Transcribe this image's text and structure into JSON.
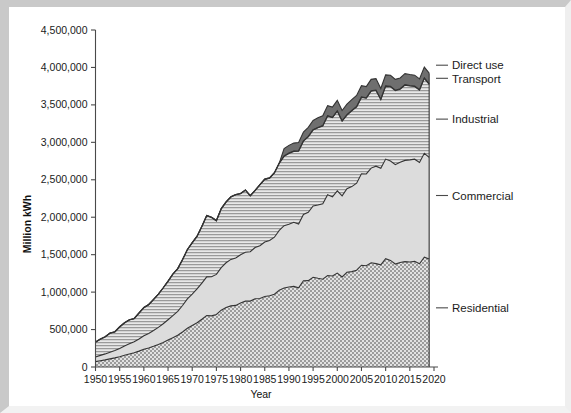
{
  "chart_data": {
    "type": "area",
    "stacked": true,
    "title": "",
    "xlabel": "Year",
    "ylabel": "Million kWh",
    "xlim": [
      1950,
      2020
    ],
    "ylim": [
      0,
      4500000
    ],
    "ytick_values": [
      0,
      500000,
      1000000,
      1500000,
      2000000,
      2500000,
      3000000,
      3500000,
      4000000,
      4500000
    ],
    "ytick_labels": [
      "0",
      "500,000",
      "1,000,000",
      "1,500,000",
      "2,000,000",
      "2,500,000",
      "3,000,000",
      "3,500,000",
      "4,000,000",
      "4,500,000"
    ],
    "xtick_values": [
      1950,
      1955,
      1960,
      1965,
      1970,
      1975,
      1980,
      1985,
      1990,
      1995,
      2000,
      2005,
      2010,
      2015,
      2020
    ],
    "xtick_labels": [
      "1950",
      "1955",
      "1960",
      "1965",
      "1970",
      "1975",
      "1980",
      "1985",
      "1990",
      "1995",
      "2000",
      "2005",
      "2010",
      "2015",
      "2020"
    ],
    "grid": false,
    "legend_position": "right-outside-leader-lines",
    "x": [
      1950,
      1951,
      1952,
      1953,
      1954,
      1955,
      1956,
      1957,
      1958,
      1959,
      1960,
      1961,
      1962,
      1963,
      1964,
      1965,
      1966,
      1967,
      1968,
      1969,
      1970,
      1971,
      1972,
      1973,
      1974,
      1975,
      1976,
      1977,
      1978,
      1979,
      1980,
      1981,
      1982,
      1983,
      1984,
      1985,
      1986,
      1987,
      1988,
      1989,
      1990,
      1991,
      1992,
      1993,
      1994,
      1995,
      1996,
      1997,
      1998,
      1999,
      2000,
      2001,
      2002,
      2003,
      2004,
      2005,
      2006,
      2007,
      2008,
      2009,
      2010,
      2011,
      2012,
      2013,
      2014,
      2015,
      2016,
      2017,
      2018,
      2019
    ],
    "series": [
      {
        "name": "Residential",
        "pattern": "dotted",
        "color": "#d2d2d2",
        "values": [
          72000,
          84000,
          95000,
          108000,
          122000,
          138000,
          156000,
          173000,
          190000,
          212000,
          236000,
          254000,
          276000,
          300000,
          327000,
          359000,
          391000,
          423000,
          468000,
          517000,
          554000,
          592000,
          638000,
          687000,
          683000,
          702000,
          759000,
          794000,
          816000,
          823000,
          856000,
          879000,
          880000,
          912000,
          915000,
          941000,
          951000,
          971000,
          1026000,
          1054000,
          1068000,
          1076000,
          1058000,
          1152000,
          1153000,
          1198000,
          1184000,
          1172000,
          1222000,
          1215000,
          1254000,
          1202000,
          1265000,
          1274000,
          1292000,
          1359000,
          1352000,
          1392000,
          1380000,
          1365000,
          1446000,
          1423000,
          1375000,
          1395000,
          1407000,
          1403000,
          1411000,
          1379000,
          1466000,
          1442000
        ]
      },
      {
        "name": "Commercial",
        "pattern": "solid-light",
        "color": "#dcdcdc",
        "values": [
          62000,
          71000,
          80000,
          90000,
          99000,
          110000,
          124000,
          136000,
          148000,
          163000,
          181000,
          194000,
          211000,
          229000,
          250000,
          272000,
          296000,
          320000,
          353000,
          392000,
          420000,
          450000,
          482000,
          516000,
          523000,
          534000,
          568000,
          598000,
          621000,
          632000,
          643000,
          654000,
          659000,
          684000,
          704000,
          727000,
          739000,
          762000,
          797000,
          833000,
          838000,
          856000,
          851000,
          885000,
          913000,
          953000,
          980000,
          1008000,
          1078000,
          1056000,
          1097000,
          1083000,
          1115000,
          1135000,
          1162000,
          1222000,
          1226000,
          1264000,
          1302000,
          1288000,
          1330000,
          1328000,
          1327000,
          1339000,
          1352000,
          1363000,
          1364000,
          1353000,
          1388000,
          1358000
        ]
      },
      {
        "name": "Industrial",
        "pattern": "hlines",
        "color": "#cbcbcb",
        "values": [
          196000,
          214000,
          226000,
          252000,
          246000,
          285000,
          308000,
          318000,
          306000,
          344000,
          374000,
          383000,
          412000,
          442000,
          478000,
          512000,
          552000,
          568000,
          610000,
          657000,
          683000,
          702000,
          756000,
          817000,
          790000,
          716000,
          785000,
          810000,
          832000,
          846000,
          815000,
          828000,
          746000,
          759000,
          814000,
          837000,
          831000,
          858000,
          896000,
          926000,
          946000,
          947000,
          973000,
          978000,
          1008000,
          1013000,
          1030000,
          1038000,
          1051000,
          1058000,
          1064000,
          997000,
          983000,
          1012000,
          1018000,
          1019000,
          1011000,
          1027000,
          1010000,
          917000,
          971000,
          991000,
          988000,
          975000,
          1004000,
          987000,
          970000,
          964000,
          1000000,
          975000
        ]
      },
      {
        "name": "Transport",
        "pattern": "dark",
        "color": "#8a8a8a",
        "values": [
          4800,
          4700,
          4600,
          4500,
          4400,
          4300,
          4200,
          4100,
          4000,
          3900,
          3800,
          3700,
          3600,
          3500,
          3400,
          3300,
          3300,
          3300,
          3300,
          3400,
          3300,
          3300,
          3300,
          3400,
          3400,
          3400,
          3500,
          3500,
          3600,
          3700,
          3800,
          3800,
          3700,
          3700,
          3700,
          3900,
          4000,
          4100,
          4200,
          4300,
          4400,
          4500,
          4600,
          4600,
          4700,
          4800,
          5000,
          5100,
          5200,
          5300,
          5400,
          5500,
          5600,
          5700,
          5800,
          5900,
          6000,
          6100,
          6100,
          6200,
          6300,
          6500,
          6600,
          6700,
          6800,
          6900,
          7000,
          7100,
          7300,
          7400
        ]
      },
      {
        "name": "Direct use",
        "pattern": "dark",
        "color": "#777777",
        "values": [
          0,
          0,
          0,
          0,
          0,
          0,
          0,
          0,
          0,
          0,
          0,
          0,
          0,
          0,
          0,
          0,
          0,
          0,
          0,
          0,
          0,
          0,
          0,
          0,
          0,
          0,
          0,
          0,
          0,
          0,
          0,
          0,
          0,
          0,
          0,
          0,
          0,
          0,
          0,
          100000,
          103000,
          106000,
          112000,
          117000,
          121000,
          124000,
          128000,
          131000,
          134000,
          137000,
          140000,
          137000,
          141000,
          144000,
          148000,
          151000,
          150000,
          152000,
          153000,
          143000,
          148000,
          147000,
          145000,
          144000,
          147000,
          146000,
          145000,
          143000,
          144000,
          141000
        ]
      }
    ],
    "series_labels": [
      {
        "name": "Direct use",
        "y_value": 4030000
      },
      {
        "name": "Transport",
        "y_value": 3855000
      },
      {
        "name": "Industrial",
        "y_value": 3310000
      },
      {
        "name": "Commercial",
        "y_value": 2290000
      },
      {
        "name": "Residential",
        "y_value": 790000
      }
    ]
  }
}
